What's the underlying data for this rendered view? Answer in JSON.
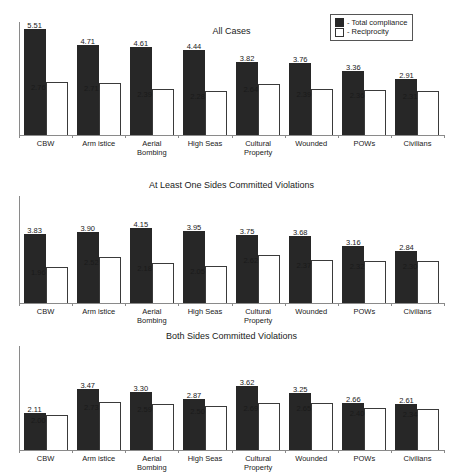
{
  "legend": {
    "entries": [
      {
        "marker": "filled-square-icon",
        "label": "- Total compliance"
      },
      {
        "marker": "hollow-square-icon",
        "label": "- Reciprocity"
      }
    ]
  },
  "chart_data": [
    {
      "type": "bar",
      "title": "All Cases",
      "xlabel": "",
      "ylabel": "",
      "ylim": [
        0,
        5.9
      ],
      "grid": false,
      "legend_position": "top-right",
      "categories": [
        "CBW",
        "Arm istice",
        "Aerial Bombing",
        "High Seas",
        "Cultural Property",
        "Wounded",
        "POWs",
        "Civilians"
      ],
      "series": [
        {
          "name": "Total compliance",
          "values": [
            5.51,
            4.71,
            4.61,
            4.44,
            3.82,
            3.76,
            3.36,
            2.91
          ]
        },
        {
          "name": "Reciprocity",
          "values": [
            2.76,
            2.71,
            2.39,
            2.28,
            2.64,
            2.39,
            2.36,
            2.31
          ]
        }
      ]
    },
    {
      "type": "bar",
      "title": "At Least One Sides Committed Violations",
      "xlabel": "",
      "ylabel": "",
      "ylim": [
        0,
        5.9
      ],
      "grid": false,
      "categories": [
        "CBW",
        "Arm istice",
        "Aerial Bombing",
        "High Seas",
        "Cultural Property",
        "Wounded",
        "POWs",
        "Civilians"
      ],
      "series": [
        {
          "name": "Total compliance",
          "values": [
            3.83,
            3.9,
            4.15,
            3.95,
            3.75,
            3.68,
            3.16,
            2.84
          ]
        },
        {
          "name": "Reciprocity",
          "values": [
            1.96,
            2.52,
            2.18,
            2.05,
            2.62,
            2.37,
            2.32,
            2.3
          ]
        }
      ]
    },
    {
      "type": "bar",
      "title": "Both Sides Committed Violations",
      "xlabel": "",
      "ylabel": "",
      "ylim": [
        0,
        5.9
      ],
      "grid": false,
      "categories": [
        "CBW",
        "Arm istice",
        "Aerial Bombing",
        "High Seas",
        "Cultural Property",
        "Wounded",
        "POWs",
        "Civilians"
      ],
      "series": [
        {
          "name": "Total compliance",
          "values": [
            2.11,
            3.47,
            3.3,
            2.87,
            3.62,
            3.25,
            2.66,
            2.61
          ]
        },
        {
          "name": "Reciprocity",
          "values": [
            2.0,
            2.73,
            2.59,
            2.5,
            2.69,
            2.65,
            2.4,
            2.34
          ]
        }
      ]
    }
  ],
  "colors": {
    "total_compliance": "#272727",
    "reciprocity": "#ffffff",
    "axis": "#8a8a8a",
    "text": "#1a1a1a"
  }
}
